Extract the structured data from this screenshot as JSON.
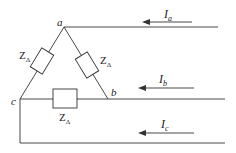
{
  "diagram": {
    "type": "circuit",
    "nodes": [
      {
        "id": "a",
        "label": "a"
      },
      {
        "id": "b",
        "label": "b"
      },
      {
        "id": "c",
        "label": "c"
      }
    ],
    "impedances": [
      {
        "between": [
          "a",
          "c"
        ],
        "label_main": "Z",
        "label_sub": "Δ"
      },
      {
        "between": [
          "a",
          "b"
        ],
        "label_main": "Z",
        "label_sub": "Δ"
      },
      {
        "between": [
          "c",
          "b"
        ],
        "label_main": "Z",
        "label_sub": "Δ"
      }
    ],
    "currents": [
      {
        "line": "a",
        "label_main": "I",
        "label_sub": "a",
        "direction": "left"
      },
      {
        "line": "b",
        "label_main": "I",
        "label_sub": "b",
        "direction": "left"
      },
      {
        "line": "c",
        "label_main": "I",
        "label_sub": "c",
        "direction": "left"
      }
    ],
    "colors": {
      "line": "#333333",
      "background": "#ffffff"
    }
  }
}
